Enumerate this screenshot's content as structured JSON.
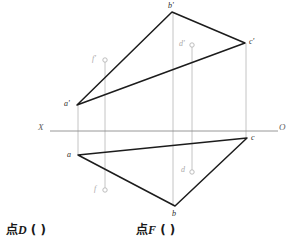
{
  "drawing": {
    "title_prompts": [
      {
        "id": "point-d",
        "prefix": "点",
        "letter": "D",
        "answer_blank": "(      )"
      },
      {
        "id": "point-f",
        "prefix": "点",
        "letter": "F",
        "answer_blank": "(      )"
      }
    ],
    "axis": {
      "left_label": "X",
      "right_label": "O",
      "y": 131,
      "x_start": 50,
      "x_end": 278,
      "color": "#8c8c8c"
    },
    "colors": {
      "outline": "#1c1c1c",
      "projector": "#b5b5b5",
      "axis": "#8c8c8c",
      "label": "#2b2b2b",
      "label_faint": "#a9a9a9",
      "background": "#ffffff"
    },
    "frontal_triangle": {
      "name": "frontal-projection-triangle",
      "points": "77,105 172,12 245,43",
      "vertices": [
        {
          "label": "b'",
          "x": 172,
          "y": 12,
          "lx": 168,
          "ly": 2
        },
        {
          "label": "c'",
          "x": 245,
          "y": 43,
          "lx": 249,
          "ly": 38
        },
        {
          "label": "a'",
          "x": 77,
          "y": 105,
          "lx": 64,
          "ly": 100
        }
      ]
    },
    "horizontal_triangle": {
      "name": "horizontal-projection-triangle",
      "points": "78,155 175,206 247,138",
      "vertices": [
        {
          "label": "a",
          "x": 78,
          "y": 155,
          "lx": 67,
          "ly": 151
        },
        {
          "label": "b",
          "x": 175,
          "y": 206,
          "lx": 172,
          "ly": 210
        },
        {
          "label": "c",
          "x": 247,
          "y": 138,
          "lx": 251,
          "ly": 134
        }
      ]
    },
    "projector_lines": [
      {
        "name": "projector-a",
        "x": 78,
        "y1": 105,
        "y2": 155
      },
      {
        "name": "projector-b",
        "x": 173,
        "y1": 12,
        "y2": 206
      },
      {
        "name": "projector-c",
        "x": 246,
        "y1": 43,
        "y2": 138
      },
      {
        "name": "projector-f",
        "x": 105,
        "y1": 60,
        "y2": 190
      },
      {
        "name": "projector-d",
        "x": 192,
        "y1": 45,
        "y2": 172
      }
    ],
    "free_points": [
      {
        "name": "point-f-frontal",
        "label": "f'",
        "x": 105,
        "y": 60,
        "lx": 92,
        "ly": 55,
        "r": 2.2
      },
      {
        "name": "point-f-horizontal",
        "label": "f",
        "x": 105,
        "y": 190,
        "lx": 94,
        "ly": 185,
        "r": 2.2
      },
      {
        "name": "point-d-frontal",
        "label": "d'",
        "x": 192,
        "y": 45,
        "lx": 179,
        "ly": 40,
        "r": 2.2
      },
      {
        "name": "point-d-horizontal",
        "label": "d",
        "x": 192,
        "y": 172,
        "lx": 181,
        "ly": 166,
        "r": 2.2
      }
    ]
  }
}
